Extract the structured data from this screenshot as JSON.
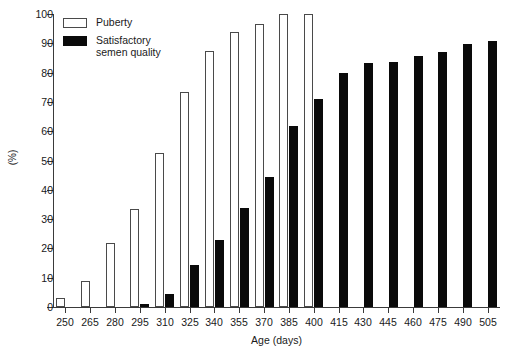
{
  "chart_data": {
    "type": "bar",
    "title": "",
    "xlabel": "Age (days)",
    "ylabel": "(%)",
    "ylim": [
      0,
      100
    ],
    "yticks": [
      0,
      10,
      20,
      30,
      40,
      50,
      60,
      70,
      80,
      90,
      100
    ],
    "grid": false,
    "legend_position": "top-left",
    "categories": [
      250,
      265,
      280,
      295,
      310,
      325,
      340,
      355,
      370,
      385,
      400,
      415,
      430,
      445,
      460,
      475,
      490,
      505
    ],
    "series": [
      {
        "name": "Puberty",
        "color": "#ffffff",
        "edge_color": "#4a4a4a",
        "values": [
          3,
          9,
          22,
          33.5,
          52.5,
          73.3,
          87.5,
          94,
          96.5,
          100,
          100,
          null,
          null,
          null,
          null,
          null,
          null,
          null
        ]
      },
      {
        "name": "Satisfactory semen quality",
        "color": "#0a0a0a",
        "edge_color": "#0a0a0a",
        "values": [
          null,
          null,
          null,
          1,
          4.5,
          14.5,
          22.8,
          33.7,
          44.5,
          61.8,
          71,
          79.8,
          83.3,
          83.5,
          85.8,
          87,
          89.8,
          90.8
        ]
      }
    ]
  },
  "legend": {
    "items": [
      {
        "label": "Puberty",
        "swatch": "open-square-swatch"
      },
      {
        "label": "Satisfactory\nsemen quality",
        "swatch": "filled-square-swatch"
      }
    ]
  },
  "axes": {
    "y_title": "(%)",
    "x_title": "Age (days)"
  }
}
